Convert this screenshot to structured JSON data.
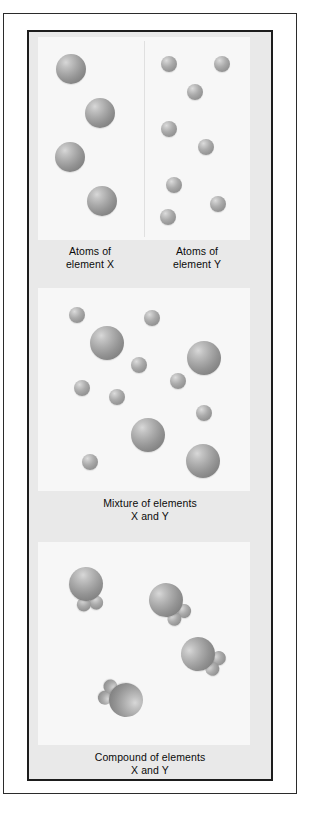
{
  "figure": {
    "colors": {
      "page_background": "#ffffff",
      "plate_background": "#e9e9e9",
      "stage_background": "#f7f7f7",
      "frame_border": "#1d1d1d",
      "outer_border": "#2b2b2b",
      "divider": "#e0e0e0",
      "sphere_gray": "#9a9a9a",
      "text": "#0b0b0b"
    }
  },
  "sections": {
    "elements": {
      "caption_x_line1": "Atoms of",
      "caption_x_line2": "element X",
      "caption_y_line1": "Atoms of",
      "caption_y_line2": "element Y",
      "atom_x_count": 4,
      "atom_y_count": 8
    },
    "mixture": {
      "caption_line1": "Mixture of elements",
      "caption_line2": "X and Y",
      "large_count": 4,
      "small_count": 9
    },
    "compound": {
      "caption_line1": "Compound of elements",
      "caption_line2": "X and Y",
      "molecule_count": 4,
      "atoms_per_molecule": "1 X + 2 Y"
    }
  },
  "chart_data": {
    "type": "scatter",
    "panels": [
      {
        "name": "atoms-of-element-x",
        "label": "Atoms of element X",
        "species": "X",
        "radius_px": 15,
        "points": [
          {
            "x": 33,
            "y": 32
          },
          {
            "x": 62,
            "y": 76
          },
          {
            "x": 32,
            "y": 120
          },
          {
            "x": 64,
            "y": 164
          }
        ]
      },
      {
        "name": "atoms-of-element-y",
        "label": "Atoms of element Y",
        "species": "Y",
        "radius_px": 8,
        "points": [
          {
            "x": 25,
            "y": 27
          },
          {
            "x": 78,
            "y": 27
          },
          {
            "x": 51,
            "y": 55
          },
          {
            "x": 25,
            "y": 92
          },
          {
            "x": 62,
            "y": 110
          },
          {
            "x": 30,
            "y": 148
          },
          {
            "x": 74,
            "y": 167
          },
          {
            "x": 24,
            "y": 180
          }
        ]
      },
      {
        "name": "mixture-of-elements-x-and-y",
        "label": "Mixture of elements X and Y",
        "large_points": [
          {
            "x": 69,
            "y": 55
          },
          {
            "x": 166,
            "y": 70
          },
          {
            "x": 110,
            "y": 147
          },
          {
            "x": 165,
            "y": 173
          }
        ],
        "small_points": [
          {
            "x": 39,
            "y": 27
          },
          {
            "x": 114,
            "y": 30
          },
          {
            "x": 101,
            "y": 77
          },
          {
            "x": 44,
            "y": 100
          },
          {
            "x": 140,
            "y": 93
          },
          {
            "x": 79,
            "y": 109
          },
          {
            "x": 166,
            "y": 125
          },
          {
            "x": 52,
            "y": 174
          }
        ],
        "large_radius_px": 17,
        "small_radius_px": 8
      },
      {
        "name": "compound-of-elements-x-and-y",
        "label": "Compound of elements X and Y",
        "molecules": [
          {
            "x": 48,
            "y": 42,
            "rotation_deg": 20
          },
          {
            "x": 128,
            "y": 58,
            "rotation_deg": -10
          },
          {
            "x": 160,
            "y": 112,
            "rotation_deg": -30
          },
          {
            "x": 88,
            "y": 158,
            "rotation_deg": 145
          }
        ],
        "large_radius_px": 17,
        "small_radius_px": 7
      }
    ],
    "legend": [
      "element X (large sphere)",
      "element Y (small sphere)"
    ],
    "grid": false
  }
}
